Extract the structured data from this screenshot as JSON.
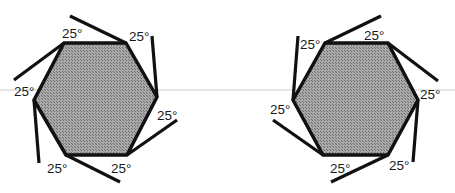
{
  "figure": {
    "colors": {
      "fill": "#9a9a9a",
      "stroke": "#111111",
      "background": "#ffffff"
    },
    "angle_label": "25°",
    "left_hexagon": {
      "labels": [
        "25°",
        "25°",
        "25°",
        "25°",
        "25°",
        "25°"
      ]
    },
    "right_hexagon": {
      "labels": [
        "25°",
        "25°",
        "25°",
        "25°",
        "25°",
        "25°"
      ]
    }
  }
}
